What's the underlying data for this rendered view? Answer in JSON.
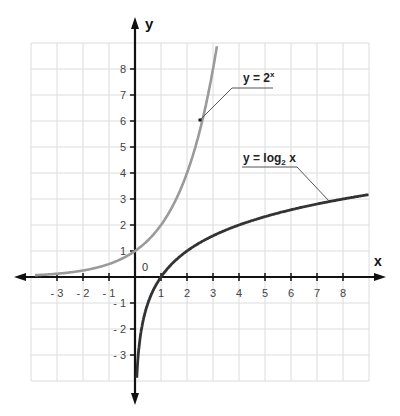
{
  "chart_data": {
    "type": "line",
    "title": "",
    "xlabel": "x",
    "ylabel": "y",
    "xlim": [
      -4,
      9
    ],
    "ylim": [
      -4,
      9
    ],
    "grid": true,
    "origin_label": "0",
    "x_ticks": [
      -3,
      -2,
      -1,
      1,
      2,
      3,
      4,
      5,
      6,
      7,
      8
    ],
    "y_ticks": [
      -3,
      -2,
      -1,
      1,
      2,
      3,
      4,
      5,
      6,
      7,
      8
    ],
    "x_tick_labels": [
      "- 3",
      "- 2",
      "- 1",
      "1",
      "2",
      "3",
      "4",
      "5",
      "6",
      "7",
      "8"
    ],
    "y_tick_labels": [
      "- 3",
      "- 2",
      "- 1",
      "1",
      "2",
      "3",
      "4",
      "5",
      "6",
      "7",
      "8"
    ],
    "series": [
      {
        "name": "y = 2^x",
        "label_main": "y = 2",
        "label_sup": "x",
        "color": "#9a9a9a",
        "function": "exp2",
        "x": [
          -3.8,
          -3,
          -2,
          -1,
          0,
          1,
          2,
          2.5,
          3,
          3.15
        ],
        "values": [
          0.07,
          0.125,
          0.25,
          0.5,
          1,
          2,
          4,
          5.66,
          8,
          8.9
        ],
        "annotation_point": [
          2.4,
          5.3
        ]
      },
      {
        "name": "y = log2 x",
        "label_main": "y = log",
        "label_sub": "2",
        "label_tail": " x",
        "color": "#333333",
        "function": "log2",
        "x": [
          0.07,
          0.125,
          0.25,
          0.5,
          1,
          2,
          4,
          8,
          9
        ],
        "values": [
          -3.84,
          -3,
          -2,
          -1,
          0,
          1,
          2,
          3,
          3.17
        ],
        "annotation_point": [
          7.5,
          2.9
        ]
      }
    ],
    "legend_position": "inline annotations"
  }
}
